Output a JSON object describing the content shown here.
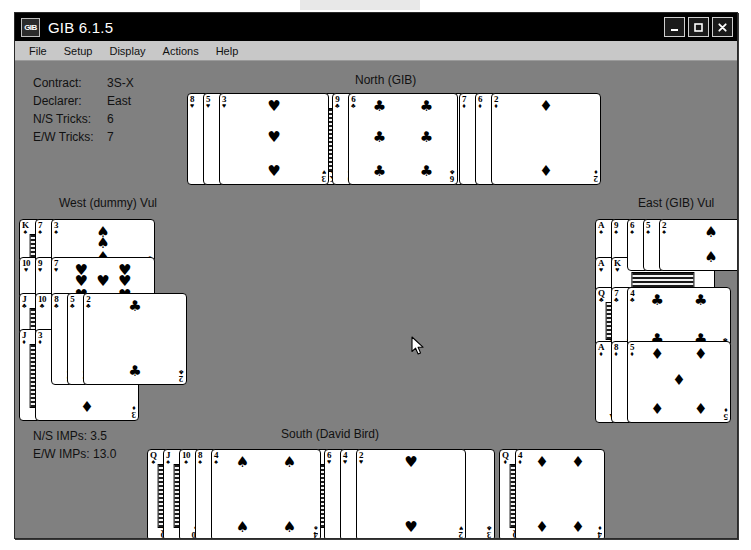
{
  "window": {
    "title": "GIB 6.1.5",
    "app_icon": "GIB",
    "buttons": {
      "minimize": "minimize-button",
      "maximize": "maximize-button",
      "close": "close-button"
    }
  },
  "menubar": {
    "items": [
      "File",
      "Setup",
      "Display",
      "Actions",
      "Help"
    ]
  },
  "contract_info": {
    "rows": [
      {
        "label": "Contract:",
        "value": "3S-X"
      },
      {
        "label": "Declarer:",
        "value": "East"
      },
      {
        "label": "N/S Tricks:",
        "value": "6"
      },
      {
        "label": "E/W Tricks:",
        "value": "7"
      }
    ]
  },
  "imps_info": {
    "ns": "N/S IMPs: 3.5",
    "ew": "E/W IMPs: 13.0"
  },
  "seats": {
    "north": "North (GIB)",
    "south": "South (David Bird)",
    "west": "West (dummy) Vul",
    "east": "East (GIB) Vul"
  },
  "hands": {
    "north": {
      "hearts": [
        "8",
        "5",
        "3"
      ],
      "clubs": [
        "A",
        "K",
        "9",
        "6"
      ],
      "diamonds": [
        "K",
        "10",
        "9",
        "7",
        "6",
        "2"
      ]
    },
    "west": {
      "spades": [
        "K",
        "7",
        "3"
      ],
      "hearts": [
        "10",
        "9",
        "7"
      ],
      "clubs": [
        "J",
        "10",
        "8",
        "5",
        "2"
      ],
      "diamonds": [
        "J",
        "3"
      ]
    },
    "east": {
      "spades": [
        "A",
        "9",
        "6",
        "5",
        "2"
      ],
      "hearts": [
        "A",
        "K"
      ],
      "clubs": [
        "Q",
        "7",
        "4"
      ],
      "diamonds": [
        "A",
        "8",
        "5"
      ]
    },
    "south": {
      "spades": [
        "Q",
        "J",
        "10",
        "8",
        "4"
      ],
      "hearts": [
        "Q",
        "J",
        "6",
        "4",
        "2"
      ],
      "clubs": [
        "3"
      ],
      "diamonds": [
        "Q",
        "4"
      ]
    }
  },
  "suit_glyphs": {
    "spades": "♠",
    "hearts": "♥",
    "clubs": "♣",
    "diamonds": "♦"
  },
  "colors": {
    "felt": "#808080",
    "titlebar": "#000000",
    "menubar": "#c8c8c8",
    "card_face": "#ffffff",
    "ink": "#000000"
  },
  "cursor": {
    "x": 400,
    "y": 287
  }
}
